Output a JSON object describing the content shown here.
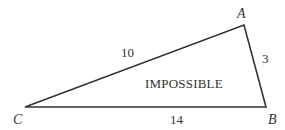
{
  "diagram": {
    "type": "triangle",
    "stroke_color": "#333333",
    "background": "#ffffff",
    "vertices": [
      {
        "id": "A",
        "label": "A",
        "x": 244,
        "y": 25
      },
      {
        "id": "B",
        "label": "B",
        "x": 266,
        "y": 107
      },
      {
        "id": "C",
        "label": "C",
        "x": 25,
        "y": 107
      }
    ],
    "sides": [
      {
        "id": "CA",
        "label": "10"
      },
      {
        "id": "AB",
        "label": "3"
      },
      {
        "id": "CB",
        "label": "14"
      }
    ],
    "center_label": "IMPOSSIBLE"
  }
}
